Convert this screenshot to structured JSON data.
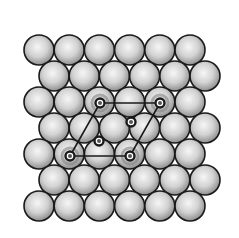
{
  "diagram": {
    "type": "close-packed surface lattice with adsorbate overlayer",
    "colors": {
      "background": "#ffffff",
      "atom_fill_center": "#f4f4f4",
      "atom_fill_edge": "#9a9a9a",
      "atom_outline": "#1a1a1a",
      "adsorbate": "#1a1a1a",
      "unit_cell_line": "#1a1a1a"
    },
    "substrate": {
      "rows": 7,
      "atoms_per_row": 6,
      "atom_radius": 15,
      "row_y": [
        50,
        76,
        102,
        128,
        154,
        180,
        206
      ],
      "row_x_start": [
        39,
        54,
        39,
        54,
        39,
        54,
        39
      ],
      "x_spacing": 30.2
    },
    "adsorbates": [
      {
        "x": 100,
        "y": 103,
        "halo": true
      },
      {
        "x": 160,
        "y": 103,
        "halo": true
      },
      {
        "x": 131,
        "y": 122,
        "halo": false
      },
      {
        "x": 99,
        "y": 141,
        "halo": false
      },
      {
        "x": 70,
        "y": 156,
        "halo": true
      },
      {
        "x": 130,
        "y": 156,
        "halo": true
      }
    ],
    "unit_cell": {
      "vertices": [
        [
          100,
          103
        ],
        [
          160,
          103
        ],
        [
          130,
          156
        ],
        [
          70,
          156
        ]
      ]
    }
  }
}
